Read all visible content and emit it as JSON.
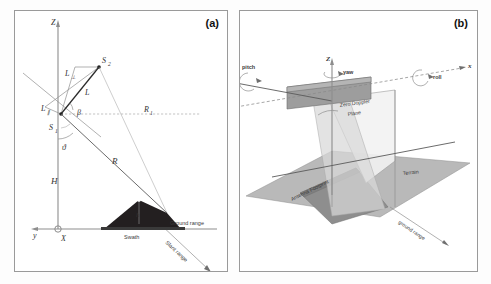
{
  "figure": {
    "type": "technical-diagram",
    "panels": [
      {
        "id": "a",
        "label": "(a)",
        "axes": {
          "vertical": "Z",
          "horizontal_left": "y",
          "origin": "X"
        },
        "labels": {
          "sensor_1": "S",
          "sensor_1_sub": "1",
          "sensor_2": "S",
          "sensor_2_sub": "2",
          "baseline": "L",
          "baseline_perp": "L",
          "baseline_perp_sub": "⊥",
          "baseline_par": "L",
          "baseline_par_sub": "∥",
          "angle_beta": "β",
          "angle_theta": "ϑ",
          "height": "H",
          "range": "R",
          "range_1": "R",
          "range_1_sub": "1",
          "target_height": "h",
          "swath": "Swath",
          "ground_range": "Ground range",
          "slant_range": "Slant range"
        }
      },
      {
        "id": "b",
        "label": "(b)",
        "axes": {
          "vertical": "Z",
          "horizontal": "x"
        },
        "labels": {
          "pitch": "pitch",
          "yaw": "yaw",
          "roll": "roll",
          "zero_doppler_plane": "Zero Doppler\nPlane",
          "zero_doppler_line1": "Zero Doppler",
          "zero_doppler_line2": "Plane",
          "antenna_footprint": "Antenna Footprint",
          "terrain": "Terrain",
          "ground_range": "ground range"
        }
      }
    ]
  },
  "colors": {
    "background": "#ffffff",
    "border": "#9a9a9a",
    "mountain": "#231f20",
    "terrain": "#b9b9b9",
    "footprint": "#8e8e8e",
    "beam": "#d8d8d8",
    "axis": "#8d8d8d",
    "text": "#333333"
  }
}
